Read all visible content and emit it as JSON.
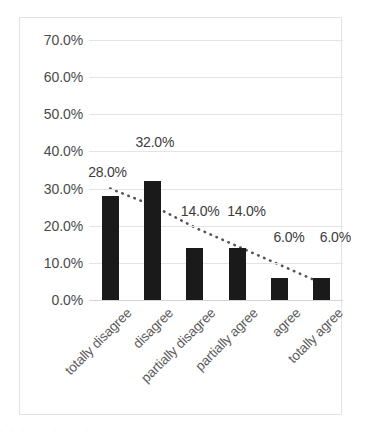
{
  "chart_data": {
    "type": "bar",
    "title": "",
    "subtitle": "",
    "xlabel": "",
    "ylabel": "",
    "categories": [
      "totally disagree",
      "disagree",
      "partially disagree",
      "partially agree",
      "agree",
      "totally agree"
    ],
    "values": [
      28.0,
      32.0,
      14.0,
      14.0,
      6.0,
      6.0
    ],
    "data_labels": [
      "28.0%",
      "32.0%",
      "14.0%",
      "14.0%",
      "6.0%",
      "6.0%"
    ],
    "ylim": [
      0,
      70
    ],
    "ytick_values": [
      0,
      10,
      20,
      30,
      40,
      50,
      60,
      70
    ],
    "ytick_labels": [
      "0.0%",
      "10.0%",
      "20.0%",
      "30.0%",
      "40.0%",
      "50.0%",
      "60.0%",
      "70.0%"
    ],
    "grid": true,
    "legend": "none",
    "series": [
      {
        "name": "response share",
        "type": "bar",
        "values": [
          28.0,
          32.0,
          14.0,
          14.0,
          6.0,
          6.0
        ],
        "color": "#1a1a1a"
      },
      {
        "name": "trendline",
        "type": "line",
        "style": "dotted",
        "color": "#555555",
        "values": [
          30.0,
          25.5,
          19.5,
          14.5,
          9.5,
          4.5
        ]
      }
    ],
    "annotations": [],
    "x_label_rotation": -45
  },
  "colors": {
    "bar": "#1a1a1a",
    "grid": "#e4e4e4",
    "axis_text": "#4a4a4a",
    "category_text": "#5a5a5a",
    "frame_border": "#e2e2e2",
    "background": "#ffffff"
  },
  "artifact": {
    "bottom_text": "· ·   · ·   · ·     · ·   · ·"
  }
}
